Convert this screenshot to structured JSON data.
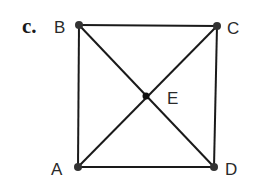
{
  "part_label": "c.",
  "points": {
    "A": {
      "label": "A",
      "x": 78,
      "y": 167
    },
    "B": {
      "label": "B",
      "x": 79,
      "y": 25
    },
    "C": {
      "label": "C",
      "x": 217,
      "y": 26
    },
    "D": {
      "label": "D",
      "x": 214,
      "y": 167
    },
    "E": {
      "label": "E",
      "x": 146,
      "y": 96
    }
  },
  "segments": [
    [
      "B",
      "C"
    ],
    [
      "C",
      "D"
    ],
    [
      "D",
      "A"
    ],
    [
      "A",
      "B"
    ],
    [
      "B",
      "D"
    ],
    [
      "A",
      "C"
    ]
  ],
  "colors": {
    "line": "#1a1a1a",
    "point": "#333333"
  }
}
